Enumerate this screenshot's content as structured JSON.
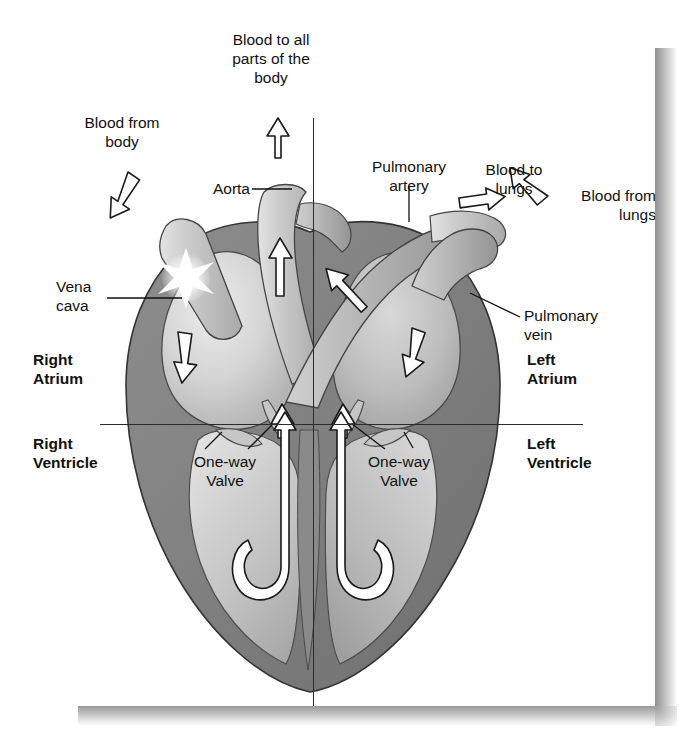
{
  "diagram": {
    "colors": {
      "myocardium_dark": "#7e7e7e",
      "myocardium_mid": "#9a9a9a",
      "chamber_light": "#d2d2d2",
      "vessel_light": "#c9c9c9",
      "outline": "#3a3a3a",
      "arrow_fill": "#ffffff",
      "arrow_stroke": "#1a1a1a",
      "text": "#111111",
      "page_background": "#ffffff"
    },
    "labels": {
      "blood_to_body": "Blood to all\nparts of the\nbody",
      "blood_from_body": "Blood from\nbody",
      "aorta": "Aorta",
      "pulmonary_artery": "Pulmonary\nartery",
      "blood_to_lungs": "Blood to\nlungs",
      "blood_from_lungs": "Blood from\nlungs",
      "vena_cava": "Vena\ncava",
      "pulmonary_vein": "Pulmonary\nvein",
      "right_atrium": "Right\nAtrium",
      "right_ventricle": "Right\nVentricle",
      "left_atrium": "Left\nAtrium",
      "left_ventricle": "Left\nVentricle",
      "one_way_valve_left": "One-way\nValve",
      "one_way_valve_right": "One-way\nValve"
    },
    "flow_arrows": [
      {
        "name": "blood-from-body-arrow",
        "direction": "down-right"
      },
      {
        "name": "blood-to-body-arrow",
        "direction": "up"
      },
      {
        "name": "aorta-flow-arrow",
        "direction": "up"
      },
      {
        "name": "pulmonary-artery-flow-arrow",
        "direction": "up-right"
      },
      {
        "name": "blood-to-lungs-arrow",
        "direction": "right"
      },
      {
        "name": "blood-from-lungs-arrow",
        "direction": "down-left"
      },
      {
        "name": "right-atrium-flow-arrow",
        "direction": "down"
      },
      {
        "name": "left-atrium-flow-arrow",
        "direction": "down"
      },
      {
        "name": "right-valve-flow-arrow",
        "direction": "up"
      },
      {
        "name": "left-valve-flow-arrow",
        "direction": "up"
      },
      {
        "name": "right-ventricle-loop-arrow",
        "direction": "u-turn-up"
      },
      {
        "name": "left-ventricle-loop-arrow",
        "direction": "u-turn-up"
      }
    ],
    "markers": [
      {
        "name": "vena-cava-starburst",
        "shape": "starburst",
        "color": "#ffffff"
      }
    ]
  }
}
